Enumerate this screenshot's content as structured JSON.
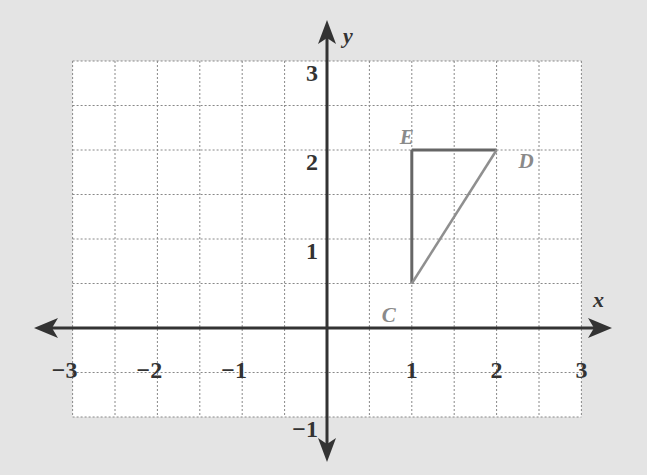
{
  "chart_data": {
    "type": "line",
    "title": "",
    "xlabel": "x",
    "ylabel": "y",
    "xlim": [
      -3,
      3
    ],
    "ylim": [
      -1,
      3
    ],
    "grid": true,
    "grid_step": 0.5,
    "x_ticks": [
      "−3",
      "−2",
      "−1",
      "1",
      "2",
      "3"
    ],
    "y_ticks": [
      "3",
      "2",
      "1",
      "−1"
    ],
    "points": [
      {
        "label": "C",
        "x": 1,
        "y": 0.5
      },
      {
        "label": "D",
        "x": 2,
        "y": 2
      },
      {
        "label": "E",
        "x": 1,
        "y": 2
      }
    ],
    "series": [
      {
        "name": "triangle CDE",
        "x": [
          1,
          2,
          1,
          1
        ],
        "y": [
          0.5,
          2,
          2,
          0.5
        ]
      }
    ]
  },
  "colors": {
    "background": "#e4e4e4",
    "grid_bg": "#ffffff",
    "grid_line": "#888888",
    "axis": "#333333",
    "segment_ED": "#666666",
    "segment_EC": "#666666",
    "segment_CD": "#8f8f8f",
    "point_label": "#8a8a8a"
  }
}
